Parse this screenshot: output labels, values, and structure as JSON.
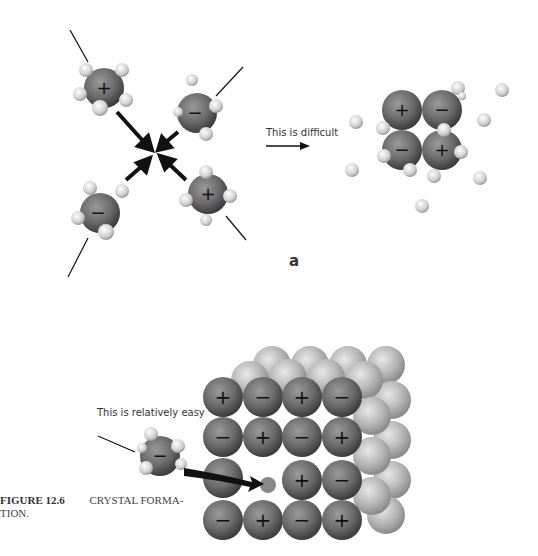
{
  "figure": {
    "number_label": "FIGURE 12.6",
    "caption_text": "CRYSTAL FORMA-",
    "caption_continuation": "TION."
  },
  "panel_a": {
    "label": "a",
    "arrow_text": "This is difficult",
    "hydrated_ions": [
      {
        "charge": "+",
        "position": "top-left"
      },
      {
        "charge": "−",
        "position": "top-right"
      },
      {
        "charge": "−",
        "position": "bottom-left"
      },
      {
        "charge": "+",
        "position": "bottom-right"
      }
    ],
    "cluster_ions": [
      "+",
      "−",
      "−",
      "+"
    ]
  },
  "panel_b": {
    "arrow_text": "This is relatively easy",
    "incoming_ion": "−",
    "lattice_rows": [
      [
        "+",
        "−",
        "+",
        "−"
      ],
      [
        "−",
        "+",
        "−",
        "+"
      ],
      [
        "",
        "",
        "+",
        "−"
      ],
      [
        "−",
        "+",
        "−",
        "+"
      ]
    ]
  }
}
